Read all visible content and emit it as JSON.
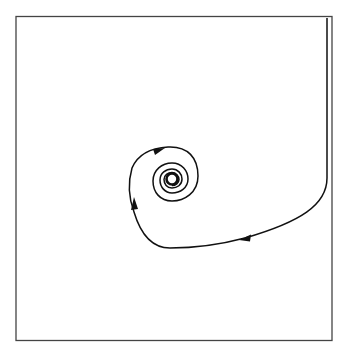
{
  "diagram": {
    "type": "phase-portrait",
    "stroke_color": "#111111",
    "frame_color": "#444444",
    "background": "#ffffff",
    "frame": {
      "x": 16,
      "y": 16,
      "width": 316,
      "height": 324
    },
    "focus_point": {
      "x": 172,
      "y": 179
    },
    "arrows": [
      {
        "x": 245,
        "y": 238,
        "direction": "left"
      },
      {
        "x": 136,
        "y": 205,
        "direction": "up"
      },
      {
        "x": 160,
        "y": 150,
        "direction": "right"
      }
    ]
  }
}
